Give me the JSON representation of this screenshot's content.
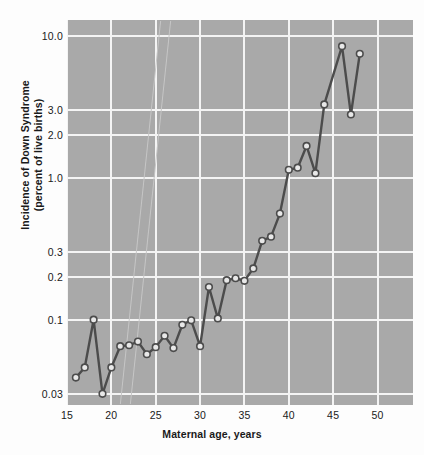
{
  "chart_data": {
    "type": "line",
    "title": "",
    "xlabel": "Maternal age, years",
    "ylabel": "Incidence of Down Syndrome (percent of live births)",
    "ylabel_line1": "Incidence of Down Syndrome",
    "ylabel_line2": "(percent of live births)",
    "yscale": "log",
    "xscale": "linear",
    "xlim": [
      15,
      54
    ],
    "ylim": [
      0.025,
      13.0
    ],
    "grid": true,
    "legend": false,
    "xticks": [
      15,
      20,
      25,
      30,
      35,
      40,
      45,
      50
    ],
    "xtick_labels": [
      "15",
      "20",
      "25",
      "30",
      "35",
      "40",
      "45",
      "50"
    ],
    "yticks": [
      0.03,
      0.1,
      0.2,
      0.3,
      1.0,
      2.0,
      3.0,
      10.0
    ],
    "ytick_labels": [
      "0.03",
      "0.1",
      "0.2",
      "0.3",
      "1.0",
      "2.0",
      "3.0",
      "10.0"
    ],
    "marker": "circle",
    "line_color": "#4c4c4c",
    "marker_fill": "#e8e8e8",
    "plot_background": "#a9a9a9",
    "gridline_color": "#f4f4f4",
    "x": [
      16,
      17,
      18,
      19,
      20,
      21,
      22,
      23,
      24,
      25,
      26,
      27,
      28,
      29,
      30,
      31,
      32,
      33,
      34,
      35,
      36,
      37,
      38,
      39,
      40,
      41,
      42,
      43,
      44,
      46,
      47,
      48
    ],
    "values": [
      0.039,
      0.046,
      0.1,
      0.03,
      0.046,
      0.065,
      0.066,
      0.07,
      0.057,
      0.064,
      0.077,
      0.063,
      0.092,
      0.099,
      0.065,
      0.17,
      0.102,
      0.19,
      0.196,
      0.188,
      0.23,
      0.36,
      0.385,
      0.56,
      1.14,
      1.18,
      1.68,
      1.08,
      3.3,
      8.5,
      2.8,
      7.5
    ],
    "series_name": "Incidence of Down Syndrome"
  },
  "axis": {
    "y_title_line1": "Incidence of Down Syndrome",
    "y_title_line2": "(percent of live births)",
    "x_title": "Maternal age, years"
  }
}
